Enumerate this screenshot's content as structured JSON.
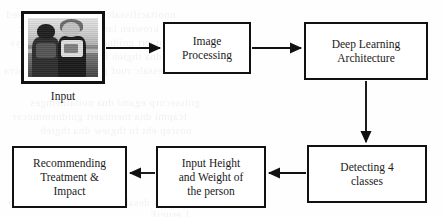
{
  "diagram": {
    "type": "flowchart",
    "orientation": "two-row serpentine, left-to-right then right-to-left",
    "background_color": "#fefefe",
    "line_color": "#111111",
    "box_fill": "#ffffff",
    "nodes": [
      {
        "id": "input-image",
        "kind": "image-thumbnail",
        "label": "",
        "caption": "Input",
        "image_description": "grayscale photograph of two people standing outdoors",
        "x": 21,
        "y": 11,
        "w": 84,
        "h": 73
      },
      {
        "id": "image-processing",
        "kind": "process-box",
        "label": "Image\nProcessing",
        "x": 163,
        "y": 22,
        "w": 88,
        "h": 52
      },
      {
        "id": "deep-learning-architecture",
        "kind": "process-box",
        "label": "Deep Learning\nArchitecture",
        "x": 304,
        "y": 22,
        "w": 124,
        "h": 58
      },
      {
        "id": "detecting-4-classes",
        "kind": "process-box",
        "label": "Detecting 4\nclasses",
        "x": 307,
        "y": 145,
        "w": 120,
        "h": 58
      },
      {
        "id": "input-height-weight",
        "kind": "process-box",
        "label": "Input Height\nand Weight of\nthe person",
        "x": 156,
        "y": 146,
        "w": 110,
        "h": 62
      },
      {
        "id": "recommending-treatment",
        "kind": "process-box",
        "label": "Recommending\nTreatment &\nImpact",
        "x": 12,
        "y": 146,
        "w": 115,
        "h": 62
      }
    ],
    "edges": [
      {
        "id": "edge-input-to-processing",
        "from": "input-image",
        "to": "image-processing",
        "direction": "right"
      },
      {
        "id": "edge-processing-to-architecture",
        "from": "image-processing",
        "to": "deep-learning-architecture",
        "direction": "right"
      },
      {
        "id": "edge-architecture-to-detecting",
        "from": "deep-learning-architecture",
        "to": "detecting-4-classes",
        "direction": "down"
      },
      {
        "id": "edge-detecting-to-height-weight",
        "from": "detecting-4-classes",
        "to": "input-height-weight",
        "direction": "left"
      },
      {
        "id": "edge-height-weight-to-recommending",
        "from": "input-height-weight",
        "to": "recommending-treatment",
        "direction": "left"
      }
    ],
    "bleed_through_artifacts": [
      "faint mirrored text showing through scanned page"
    ]
  }
}
